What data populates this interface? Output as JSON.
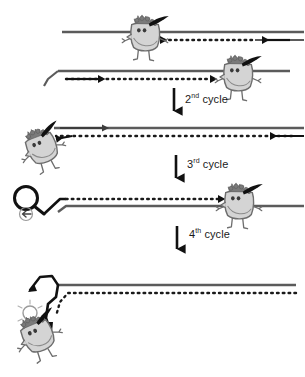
{
  "figure": {
    "type": "process-diagram",
    "width": 304,
    "height": 377,
    "background_color": "#ffffff"
  },
  "colors": {
    "template_strand": "#5b5b5b",
    "new_strand_dotted": "#1a1a1a",
    "polymerase_body_fill": "#d4d4d4",
    "polymerase_body_stroke": "#6e6e6e",
    "polymerase_hair": "#7a7a7a",
    "arrow_black": "#111111",
    "label_text": "#1a1a1a",
    "loop_stroke": "#111111"
  },
  "steps": [
    {
      "id": "step-1",
      "name": "first-cycle-panel",
      "description": "Top duplex: upper solid template strand with polymerase extending a dotted strand leftwards",
      "strands": [
        {
          "name": "template-strand-top",
          "style": "solid",
          "direction": "left"
        },
        {
          "name": "nascent-strand-top",
          "style": "dotted",
          "direction": "left"
        }
      ],
      "polymerases": [
        "polymerase-top-left"
      ]
    },
    {
      "id": "step-2",
      "name": "second-strand-panel",
      "description": "Lower duplex: solid template with flagged 5' tail, polymerase extending dotted strand rightwards",
      "strands": [
        {
          "name": "template-strand-second",
          "style": "solid",
          "direction": "right"
        },
        {
          "name": "nascent-strand-second",
          "style": "dotted",
          "direction": "right"
        }
      ],
      "polymerases": [
        "polymerase-second-right"
      ]
    },
    {
      "id": "step-3",
      "name": "second-cycle-product-panel",
      "description": "Product duplex after 2nd cycle, polymerase displaced at the left end",
      "strands": [
        {
          "name": "template-strand-third",
          "style": "solid",
          "direction": "right"
        },
        {
          "name": "nascent-strand-third",
          "style": "dotted",
          "direction": "left"
        }
      ],
      "polymerases": [
        "polymerase-third-left"
      ]
    },
    {
      "id": "step-4",
      "name": "third-cycle-product-panel",
      "description": "Product with hairpin loop at the left terminus and polymerase at right",
      "strands": [
        {
          "name": "template-strand-fourth",
          "style": "solid",
          "direction": "right"
        },
        {
          "name": "nascent-strand-fourth",
          "style": "dotted",
          "direction": "right"
        }
      ],
      "polymerases": [
        "polymerase-fourth-right"
      ],
      "features": [
        "hairpin-loop-left"
      ]
    },
    {
      "id": "step-5",
      "name": "fourth-cycle-product-panel",
      "description": "Final folded product, strand bends down at left with polymerase attached below",
      "strands": [
        {
          "name": "template-strand-final",
          "style": "solid",
          "direction": "right"
        },
        {
          "name": "nascent-strand-final",
          "style": "dotted",
          "direction": "right"
        }
      ],
      "polymerases": [
        "polymerase-final-bottom"
      ],
      "features": [
        "folded-left-terminus"
      ]
    }
  ],
  "cycle_labels": [
    {
      "ordinal": "2",
      "suffix": "nd",
      "word": "cycle"
    },
    {
      "ordinal": "3",
      "suffix": "rd",
      "word": "cycle"
    },
    {
      "ordinal": "4",
      "suffix": "th",
      "word": "cycle"
    }
  ],
  "arrows": [
    {
      "name": "transition-arrow-1",
      "direction": "down",
      "label": "2nd cycle"
    },
    {
      "name": "transition-arrow-2",
      "direction": "down",
      "label": "3rd cycle"
    },
    {
      "name": "transition-arrow-3",
      "direction": "down",
      "label": "4th cycle"
    }
  ]
}
